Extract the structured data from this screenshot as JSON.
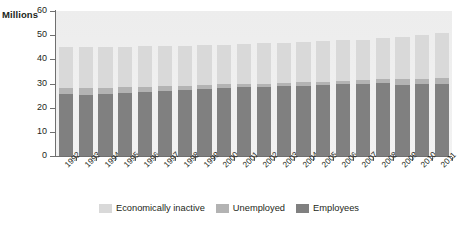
{
  "chart_data": {
    "type": "bar",
    "stacked": true,
    "title": "",
    "subtitle": "",
    "xlabel": "",
    "ylabel": "Millions",
    "ylim": [
      0,
      60
    ],
    "yticks": [
      0,
      10,
      20,
      30,
      40,
      50,
      60
    ],
    "grid": false,
    "legend_position": "bottom",
    "categories": [
      "1992",
      "1993",
      "1994",
      "1995",
      "1996",
      "1997",
      "1998",
      "1999",
      "2000",
      "2001",
      "2002",
      "2003",
      "2004",
      "2005",
      "2006",
      "2007",
      "2008",
      "2009",
      "2010",
      "2011"
    ],
    "series": [
      {
        "name": "Employees",
        "color": "#808080",
        "values": [
          25.6,
          25.4,
          25.6,
          26.0,
          26.4,
          27.0,
          27.4,
          27.8,
          28.2,
          28.4,
          28.5,
          28.8,
          29.1,
          29.4,
          29.6,
          29.9,
          30.1,
          29.5,
          29.6,
          29.7
        ]
      },
      {
        "name": "Unemployed",
        "color": "#b3b3b3",
        "values": [
          2.7,
          2.9,
          2.6,
          2.4,
          2.1,
          1.9,
          1.7,
          1.7,
          1.6,
          1.4,
          1.5,
          1.4,
          1.4,
          1.4,
          1.6,
          1.6,
          1.7,
          2.4,
          2.4,
          2.5
        ]
      },
      {
        "name": "Economically inactive",
        "color": "#d9d9d9",
        "values": [
          16.7,
          16.8,
          16.9,
          16.8,
          16.9,
          16.6,
          16.5,
          16.4,
          16.3,
          16.4,
          16.6,
          16.7,
          16.6,
          16.6,
          16.7,
          16.7,
          16.9,
          17.4,
          18.0,
          18.8
        ]
      }
    ],
    "totals": [
      45.0,
      45.1,
      45.1,
      45.2,
      45.4,
      45.5,
      45.6,
      45.9,
      46.1,
      46.2,
      46.6,
      46.9,
      47.1,
      47.4,
      47.9,
      48.2,
      48.7,
      49.3,
      50.0,
      51.0
    ],
    "legend": [
      {
        "label": "Economically inactive",
        "color": "#d9d9d9"
      },
      {
        "label": "Unemployed",
        "color": "#b3b3b3"
      },
      {
        "label": "Employees",
        "color": "#808080"
      }
    ]
  }
}
